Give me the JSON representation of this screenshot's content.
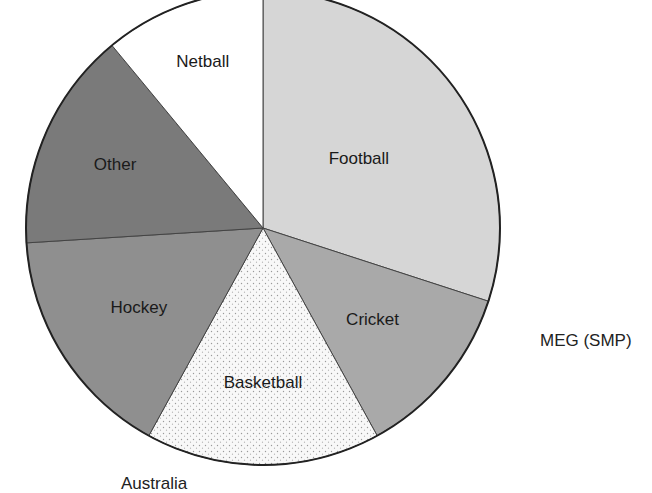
{
  "chart_data": {
    "type": "pie",
    "title": "",
    "caption": "Australia",
    "credit": "MEG (SMP)",
    "start_angle_deg": 0,
    "direction": "clockwise",
    "categories": [
      "Football",
      "Cricket",
      "Basketball",
      "Hockey",
      "Other",
      "Netball"
    ],
    "values": [
      30,
      12,
      16,
      16,
      15,
      11
    ],
    "unit": "%",
    "slices": [
      {
        "label": "Football",
        "value": 30,
        "fill": "#d6d6d6",
        "pattern": "fine-grey"
      },
      {
        "label": "Cricket",
        "value": 12,
        "fill": "#a9a9a9",
        "pattern": "medium-grey"
      },
      {
        "label": "Basketball",
        "value": 16,
        "fill": "#f7f7f7",
        "pattern": "stipple-dots"
      },
      {
        "label": "Hockey",
        "value": 16,
        "fill": "#8f8f8f",
        "pattern": "medium-dark-grey"
      },
      {
        "label": "Other",
        "value": 15,
        "fill": "#7a7a7a",
        "pattern": "dark-grey"
      },
      {
        "label": "Netball",
        "value": 11,
        "fill": "#ffffff",
        "pattern": "white"
      }
    ],
    "legend": "none (labels inside slices)"
  },
  "labels": {
    "caption": "Australia",
    "credit": "MEG (SMP)"
  }
}
